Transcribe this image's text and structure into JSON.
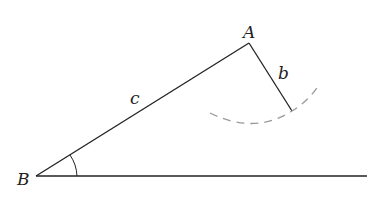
{
  "diagram": {
    "type": "triangle construction (SSA ambiguous case)",
    "labels": {
      "vertex_a": "A",
      "vertex_b": "B",
      "side_b": "b",
      "side_c": "c"
    },
    "colors": {
      "line": "#222222",
      "dashed_arc": "#999999"
    }
  }
}
